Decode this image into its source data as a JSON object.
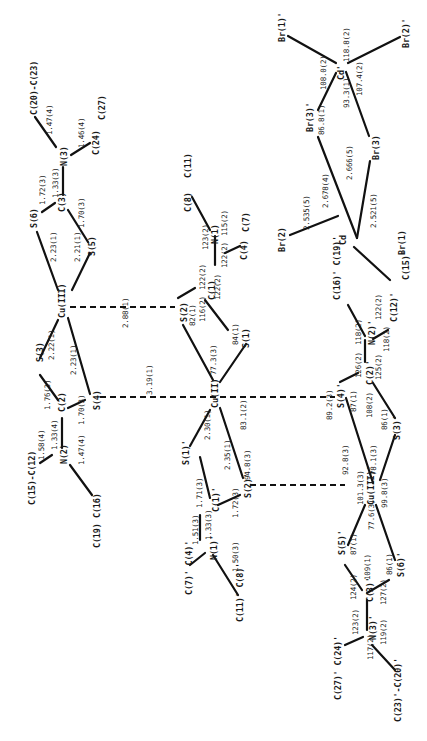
{
  "diagram": {
    "type": "crystal-structure-bond-diagram",
    "orientation": "rotated 90deg counter-clockwise",
    "colors": {
      "line": "#111111",
      "text": "#1a1a1a",
      "accent_green": "#3a9a3a",
      "accent_blue": "#2b4aa8",
      "accent_red": "#c0392b"
    },
    "atoms": {
      "cu3": "Cu(III)",
      "cu3p": "Cu(III)'",
      "cu2": "Cu(II)",
      "s1": "S(1)",
      "s2": "S(2)",
      "s3": "S(3)",
      "s4": "S(4)",
      "s5": "S(5)",
      "s6": "S(6)",
      "s1p": "S(1)'",
      "s2p": "S(2)'",
      "s3p": "S(3)'",
      "s4p": "S(4)'",
      "s5p": "S(5)'",
      "s6p": "S(6)'",
      "c1": "C(1)",
      "c2": "C(2)",
      "c3": "C(3)",
      "c1p": "C(1)'",
      "c2p": "C(2)'",
      "c3p": "C(3)'",
      "n1": "N(1)",
      "n2": "N(2)",
      "n3": "N(3)",
      "n1p": "N(1)'",
      "n2p": "N(2)'",
      "n3p": "N(3)'",
      "c4": "C(4)",
      "c7": "C(7)",
      "c8": "C(8)",
      "c11": "C(11)",
      "c15_c12": "C(15)-C(12)",
      "c16": "C(16)",
      "c19": "C(19)",
      "c20_c23": "C(20)-C(23)",
      "c24": "C(24)",
      "c27": "C(27)",
      "c7p_c4p": "C(7)' C(4)'",
      "c11p_c8p": "C(11)' C(8)'",
      "c16p_c19p": "C(16)' C(19)'",
      "c12p": "C(12)'",
      "c15p": "C(15)'",
      "c27p_c24p": "C(27)' C(24)'",
      "c23p_c20p": "C(23)'-C(20)'",
      "cd": "Cd",
      "cdp": "Cd'",
      "br1": "Br(1)",
      "br2": "Br(2)",
      "br3": "Br(3)",
      "br1p": "Br(1)'",
      "br2p": "Br(2)'",
      "br3p": "Br(3)'"
    },
    "bond_lengths": {
      "c20_n3": "1.47(4)",
      "c24_n3": "1.46(4)",
      "n3_c3": "1.33(3)",
      "s6_c3": "1.72(3)",
      "c3_s5": "1.70(3)",
      "cu3_s6": "2.23(1)",
      "cu3_s5": "2.21(1)",
      "cu3_s3": "2.22(1)",
      "cu3_s4": "2.23(1)",
      "cu3_s2": "2.88(1)",
      "s4_s4p": "3.19(1)",
      "s3_c2": "1.76(3)",
      "c2_s4": "1.70(3)",
      "c2_n2": "1.33(4)",
      "n2_c12": "1.58(4)",
      "n2_c16": "1.47(4)",
      "cu2_s1p": "2.30(1)",
      "cu2_s2p": "2.35(1)",
      "s1p_c1p": "1.71(3)",
      "c1p_s2p": "1.72(3)",
      "c1p_n1p": "1.33(3)",
      "n1p_c4p": "1.51(3)",
      "n1p_c8p": "1.50(3)",
      "cd_br2": "2.535(5)",
      "cd_br3p": "2.678(4)",
      "cd_br3": "2.666(5)",
      "cd_br1": "2.521(5)"
    },
    "bond_angles": {
      "s2": "82(1)",
      "c1_s2": "122(2)",
      "c1_n1": "122(2)",
      "c1_s1": "116(2)",
      "c1_other": "122(2)",
      "n1_c8": "123(2)",
      "n1_c4": "115(2)",
      "n1_other": "122(2)",
      "s1": "84(1)",
      "cu2_s1": "77.3(3)",
      "cu2_s4p": "83.1(2)",
      "s2p_cu2": "94.8(3)",
      "s4p_cu3p": "89.2(3)",
      "s4p": "87(1)",
      "c2p_s4p": "126(2)",
      "c2p_s3p": "108(2)",
      "c2p_n2p": "125(2)",
      "n2p_c16p": "118(2)",
      "n2p_c12p": "122(2)",
      "n2p_other": "118(2)",
      "cu3p_s4p": "92.8(3)",
      "cu3p_s2p": "101.3(3)",
      "cu3p_s3p": "78.1(3)",
      "cu3p_s6p": "99.8(3)",
      "cu3p_s5p": "77.6(3)",
      "s3p": "86(1)",
      "s5p": "87(1)",
      "c3p_s5p": "124(2)",
      "c3p_s6p": "127(2)",
      "c3p_n3p": "109(1)",
      "s6p": "86(1)",
      "n3p_c24p": "123(2)",
      "n3p_c20p": "119(2)",
      "n3p_other": "117(2)",
      "cdp_br1p_br2p": "118.8(2)",
      "cdp_br1p_br3p": "108.0(2)",
      "cdp_br3p_br3": "93.3(1)",
      "cdp_br2p_br3": "107.4(2)",
      "br3p": "86.8(1)"
    }
  }
}
